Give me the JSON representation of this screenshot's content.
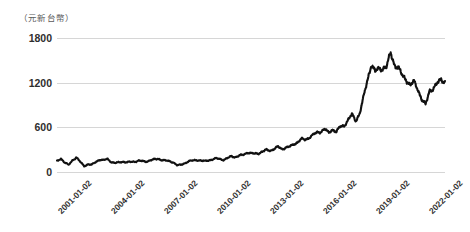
{
  "chart_data": {
    "type": "line",
    "title": "",
    "subtitle": "",
    "unit_caption": "（元新台幣）",
    "xlabel": "",
    "ylabel": "",
    "ylim": [
      0,
      1800
    ],
    "ytick_values": [
      1800,
      1200,
      600,
      0
    ],
    "ytick_labels": [
      "1800",
      "1200",
      "600",
      "0"
    ],
    "xtick_labels": [
      "2001-01-02",
      "2004-01-02",
      "2007-01-02",
      "2010-01-02",
      "2013-01-02",
      "2016-01-02",
      "2019-01-02",
      "2022-01-02"
    ],
    "xlim": [
      "2001-01-02",
      "2023-03-01"
    ],
    "grid": true,
    "grid_axis": "y",
    "legend": false,
    "legend_position": "none",
    "line_color": "#111111",
    "grid_color": "#d6d6d6",
    "series": [
      {
        "name": "股價",
        "x": [
          "2001-01-02",
          "2001-04-01",
          "2001-07-01",
          "2001-10-01",
          "2002-01-02",
          "2002-04-01",
          "2002-07-01",
          "2002-10-01",
          "2003-01-02",
          "2003-04-01",
          "2003-07-01",
          "2003-10-01",
          "2004-01-02",
          "2004-04-01",
          "2004-07-01",
          "2004-10-01",
          "2005-01-02",
          "2005-04-01",
          "2005-07-01",
          "2005-10-01",
          "2006-01-02",
          "2006-04-01",
          "2006-07-01",
          "2006-10-01",
          "2007-01-02",
          "2007-04-01",
          "2007-07-01",
          "2007-10-01",
          "2008-01-02",
          "2008-04-01",
          "2008-07-01",
          "2008-10-01",
          "2009-01-02",
          "2009-04-01",
          "2009-07-01",
          "2009-10-01",
          "2010-01-02",
          "2010-04-01",
          "2010-07-01",
          "2010-10-01",
          "2011-01-02",
          "2011-04-01",
          "2011-07-01",
          "2011-10-01",
          "2012-01-02",
          "2012-04-01",
          "2012-07-01",
          "2012-10-01",
          "2013-01-02",
          "2013-04-01",
          "2013-07-01",
          "2013-10-01",
          "2014-01-02",
          "2014-04-01",
          "2014-07-01",
          "2014-10-01",
          "2015-01-02",
          "2015-04-01",
          "2015-07-01",
          "2015-10-01",
          "2016-01-02",
          "2016-04-01",
          "2016-07-01",
          "2016-10-01",
          "2017-01-02",
          "2017-04-01",
          "2017-07-01",
          "2017-10-01",
          "2018-01-02",
          "2018-04-01",
          "2018-07-01",
          "2018-10-01",
          "2019-01-02",
          "2019-04-01",
          "2019-07-01",
          "2019-10-01",
          "2020-01-02",
          "2020-04-01",
          "2020-07-01",
          "2020-10-01",
          "2021-01-02",
          "2021-03-01",
          "2021-05-01",
          "2021-07-01",
          "2021-09-01",
          "2021-11-01",
          "2022-01-02",
          "2022-02-01",
          "2022-03-01",
          "2022-04-01",
          "2022-05-01",
          "2022-06-01",
          "2022-07-01",
          "2022-08-01",
          "2022-09-01",
          "2022-10-01",
          "2022-11-01",
          "2022-12-01",
          "2023-01-01",
          "2023-02-01",
          "2023-03-01"
        ],
        "values": [
          62,
          78,
          55,
          40,
          68,
          85,
          58,
          34,
          45,
          42,
          58,
          72,
          68,
          75,
          58,
          52,
          55,
          60,
          56,
          58,
          60,
          66,
          62,
          60,
          68,
          72,
          76,
          70,
          66,
          62,
          56,
          38,
          42,
          52,
          62,
          66,
          70,
          66,
          62,
          68,
          72,
          78,
          76,
          70,
          80,
          92,
          86,
          94,
          100,
          112,
          108,
          106,
          108,
          118,
          128,
          124,
          134,
          146,
          132,
          142,
          146,
          160,
          172,
          190,
          186,
          200,
          214,
          228,
          234,
          248,
          226,
          246,
          232,
          262,
          268,
          300,
          332,
          296,
          338,
          430,
          530,
          622,
          580,
          596,
          600,
          610,
          688,
          620,
          600,
          556,
          536,
          500,
          520,
          480,
          420,
          386,
          470,
          484,
          510,
          536,
          520
        ]
      }
    ],
    "pixel_series_note": "Dense daily closing-price line; peak near 688 (early 2022) scaled on chart to ~1600 NT$"
  },
  "chart_pixel_path": {
    "description": "Polyline points in plot-area coordinates (388x134 box, y inverted, 0 at bottom=value 0, top=value 1800)",
    "points": "0,168 2,162 4,171 6,166 8,160 10,164 12,169 14,163 16,159 18,164 20,170 22,166 24,161 26,167 28,172 30,168 32,163 34,167 36,171 38,168 40,164 42,169 44,172 46,170 48,166 50,169 52,171 54,167 56,164 58,168 60,170 62,166 64,163 66,167 68,170 70,167 72,164 74,166 76,169 78,166 80,163 82,166 84,168 86,165 88,162 90,165 92,168 94,165 96,161 98,164 100,166 102,163 104,160 106,163 108,165 110,162 112,158 114,161 116,163 118,160 120,157 122,160 124,162 126,159 128,156 130,158 132,160 134,157 136,154 138,157 140,159 142,156 144,153 146,155 148,157 150,154 152,151 154,153 156,155 158,152 160,149 162,151 164,153 166,150 168,147 170,149 172,151 174,148 176,145 178,147 180,149 182,146 184,143 186,145 188,147 190,144 192,141 194,143 196,145 198,142 200,139 202,141 204,143 206,139 208,136 210,138 212,140 214,136 216,133 218,135 220,137 222,133 224,130 226,132 228,134 230,130 232,127 234,129 236,131 238,127 240,124 242,126 244,128 246,124 248,120 250,123 252,126 254,121 256,117 258,120 260,123 262,118 264,114 266,117 268,120 270,115 272,111 274,114 276,117 278,112 280,108 282,111 284,114 286,109 288,104 290,108 292,112 294,106 296,101 298,105 300,109 302,103 304,98 306,102 308,106 310,100 312,95 314,99 316,103 318,97 320,92 322,96 324,100 326,93 328,88 330,92 332,97 334,90 336,84 338,88 340,93 342,85 344,78 346,83 348,88 350,80 352,72 354,77 356,82 358,73 360,64 362,70 364,76 366,66 368,56 370,62 372,68 374,58 376,48 378,54 380,60 382,50 384,42 386,48 388,44"
  }
}
